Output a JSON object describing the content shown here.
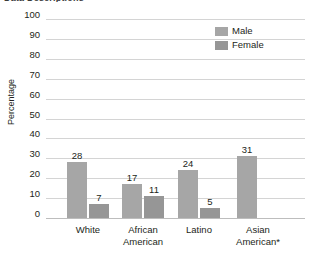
{
  "chart_data": {
    "type": "bar",
    "title": "",
    "xlabel": "",
    "ylabel": "Percentage",
    "ylim": [
      0,
      100
    ],
    "ytick_step": 10,
    "yticks": [
      "100",
      "90",
      "80",
      "70",
      "60",
      "50",
      "40",
      "30",
      "20",
      "10",
      "0"
    ],
    "grid": "horizontal",
    "legend_position": "top-right",
    "categories": [
      "White",
      "African American",
      "Latino",
      "Asian American*"
    ],
    "series": [
      {
        "name": "Male",
        "color": "#a6a6a6",
        "values": [
          28,
          17,
          24,
          31
        ]
      },
      {
        "name": "Female",
        "color": "#969696",
        "values": [
          7,
          11,
          5,
          null
        ]
      }
    ],
    "bars": [
      {
        "category": "White",
        "series": "Male",
        "value": 28,
        "label": "28"
      },
      {
        "category": "White",
        "series": "Female",
        "value": 7,
        "label": "7"
      },
      {
        "category": "African American",
        "series": "Male",
        "value": 17,
        "label": "17"
      },
      {
        "category": "African American",
        "series": "Female",
        "value": 11,
        "label": "11"
      },
      {
        "category": "Latino",
        "series": "Male",
        "value": 24,
        "label": "24"
      },
      {
        "category": "Latino",
        "series": "Female",
        "value": 5,
        "label": "5"
      },
      {
        "category": "Asian American*",
        "series": "Male",
        "value": 31,
        "label": "31"
      }
    ]
  },
  "legend": {
    "items": [
      {
        "label": "Male",
        "color": "#a6a6a6"
      },
      {
        "label": "Female",
        "color": "#969696"
      }
    ]
  },
  "axis": {
    "y_title": "Percentage"
  },
  "title_clipped": "Data Descriptions"
}
